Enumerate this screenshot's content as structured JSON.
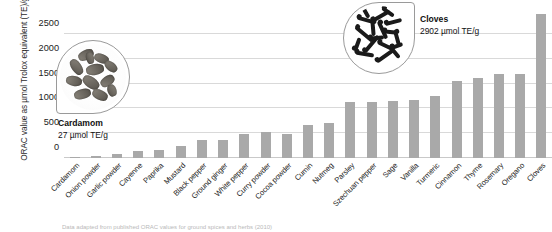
{
  "chart_data": {
    "type": "bar",
    "title": "",
    "xlabel": "",
    "ylabel": "ORAC value as µmol Trolox equivalent (TE)/g",
    "ylim": [
      0,
      2900
    ],
    "yticks": [
      0,
      500,
      1000,
      1500,
      2000,
      2500
    ],
    "ytick_labels": [
      "0",
      "500",
      "1000",
      "1500",
      "2000",
      "2500"
    ],
    "grid": true,
    "legend": "none",
    "bar_color": "#a9a9a9",
    "categories": [
      "Cardamom",
      "Onion powder",
      "Garlic powder",
      "Cayenne",
      "Paprika",
      "Mustard",
      "Black pepper",
      "Ground ginger",
      "White pepper",
      "Curry powder",
      "Cocoa powder",
      "Cumin",
      "Nutmeg",
      "Parsley",
      "Szechuan pepper",
      "Sage",
      "Vanilla",
      "Turmeric",
      "Cinnamon",
      "Thyme",
      "Rosemary",
      "Oregano",
      "Cloves"
    ],
    "values": [
      27,
      50,
      90,
      150,
      155,
      240,
      360,
      370,
      480,
      530,
      480,
      670,
      700,
      1120,
      1125,
      1140,
      1175,
      1240,
      1550,
      1610,
      1700,
      1700,
      2902
    ]
  },
  "annotations": [
    {
      "id": "cardamom",
      "name": "Cardamom",
      "value_text": "27 µmol TE/g",
      "photo": "cardamom-pods-photo"
    },
    {
      "id": "cloves",
      "name": "Cloves",
      "value_text": "2902 µmol TE/g",
      "photo": "clove-buds-photo"
    }
  ],
  "caption": {
    "text": "Data adapted from published ORAC values for ground spices and herbs (2010)"
  }
}
